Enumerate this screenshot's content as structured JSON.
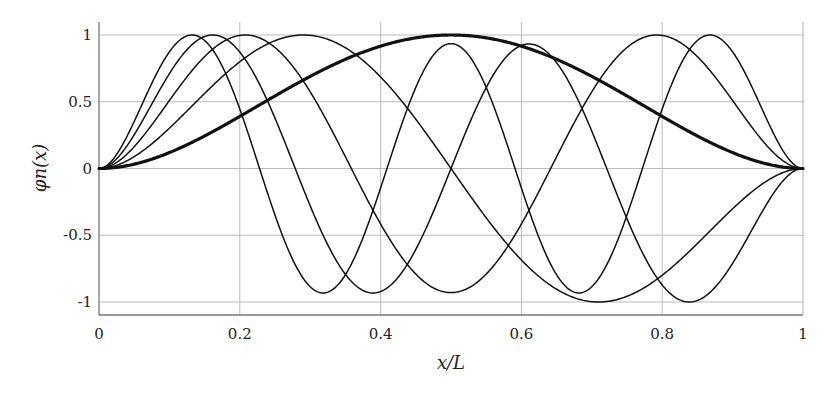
{
  "chart_data": {
    "type": "line",
    "title": "",
    "xlabel": "x/L",
    "ylabel": "φn(x)",
    "xlim": [
      0,
      1
    ],
    "ylim": [
      -1.1,
      1.1
    ],
    "grid": true,
    "legend": null,
    "x_ticks": [
      0,
      0.2,
      0.4,
      0.6,
      0.8,
      1
    ],
    "x_tick_labels": [
      "0",
      "0.2",
      "0.4",
      "0.6",
      "0.8",
      "1"
    ],
    "y_ticks": [
      1,
      0.5,
      0,
      -0.5,
      -1
    ],
    "y_tick_labels": [
      "1",
      "0.5",
      "0",
      "-0.5",
      "-1"
    ],
    "series": [
      {
        "name": "n=1",
        "betaL": 4.73,
        "emphasis": "thick",
        "peaks": [
          [
            0.5,
            1.0
          ]
        ],
        "sample_x": [
          0,
          0.1,
          0.2,
          0.3,
          0.4,
          0.5,
          0.6,
          0.7,
          0.8,
          0.9,
          1
        ],
        "values": [
          0,
          0.13,
          0.4,
          0.7,
          0.92,
          1.0,
          0.92,
          0.7,
          0.4,
          0.13,
          0
        ]
      },
      {
        "name": "n=2",
        "betaL": 7.8532,
        "emphasis": "normal",
        "peaks": [
          [
            0.29,
            1.0
          ],
          [
            0.71,
            -1.0
          ]
        ],
        "sample_x": [
          0,
          0.1,
          0.2,
          0.3,
          0.4,
          0.5,
          0.6,
          0.7,
          0.8,
          0.9,
          1
        ],
        "values": [
          0,
          0.3,
          0.8,
          1.0,
          0.64,
          0,
          -0.64,
          -1.0,
          -0.8,
          -0.3,
          0
        ]
      },
      {
        "name": "n=3",
        "betaL": 10.9956,
        "emphasis": "normal",
        "peaks": [
          [
            0.21,
            1.0
          ],
          [
            0.5,
            -0.93
          ],
          [
            0.79,
            1.0
          ]
        ],
        "sample_x": [
          0,
          0.1,
          0.2,
          0.3,
          0.4,
          0.5,
          0.6,
          0.7,
          0.8,
          0.9,
          1
        ],
        "values": [
          0,
          0.5,
          1.0,
          0.64,
          -0.3,
          -0.93,
          -0.3,
          0.64,
          1.0,
          0.5,
          0
        ]
      },
      {
        "name": "n=4",
        "betaL": 14.1372,
        "emphasis": "normal",
        "peaks": [
          [
            0.16,
            1.0
          ],
          [
            0.39,
            -0.93
          ],
          [
            0.61,
            0.93
          ],
          [
            0.84,
            -1.0
          ]
        ],
        "sample_x": [
          0,
          0.1,
          0.2,
          0.3,
          0.4,
          0.5,
          0.6,
          0.7,
          0.8,
          0.9,
          1
        ],
        "values": [
          0,
          0.7,
          0.85,
          -0.4,
          -0.92,
          0,
          0.92,
          0.4,
          -0.85,
          -0.7,
          0
        ]
      },
      {
        "name": "n=5",
        "betaL": 17.2788,
        "emphasis": "normal",
        "peaks": [
          [
            0.13,
            1.0
          ],
          [
            0.32,
            -0.93
          ],
          [
            0.5,
            0.93
          ],
          [
            0.68,
            -0.93
          ],
          [
            0.87,
            1.0
          ]
        ],
        "sample_x": [
          0,
          0.1,
          0.2,
          0.3,
          0.4,
          0.5,
          0.6,
          0.7,
          0.8,
          0.9,
          1
        ],
        "values": [
          0,
          0.85,
          0.4,
          -0.9,
          0.05,
          0.93,
          0.05,
          -0.9,
          0.4,
          0.85,
          0
        ]
      }
    ]
  },
  "colors": {
    "curve": "#111111",
    "axis": "#777777",
    "grid": "#bbbbbb",
    "text": "#222222"
  }
}
